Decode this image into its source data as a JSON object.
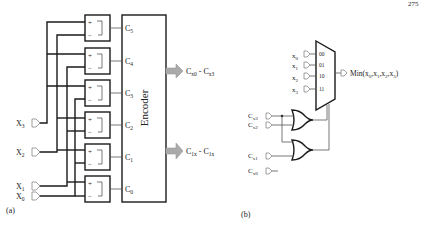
{
  "page_number": "275",
  "panel_a": {
    "caption": "(a)",
    "inputs": [
      {
        "name": "X",
        "sub": "3"
      },
      {
        "name": "X",
        "sub": "2"
      },
      {
        "name": "X",
        "sub": "1"
      },
      {
        "name": "X",
        "sub": "0"
      }
    ],
    "comparators": [
      {
        "plus": "+",
        "minus": "−",
        "out": "C",
        "out_sub": "5"
      },
      {
        "plus": "+",
        "minus": "−",
        "out": "C",
        "out_sub": "4"
      },
      {
        "plus": "+",
        "minus": "−",
        "out": "C",
        "out_sub": "3"
      },
      {
        "plus": "+",
        "minus": "−",
        "out": "C",
        "out_sub": "2"
      },
      {
        "plus": "+",
        "minus": "−",
        "out": "C",
        "out_sub": "1"
      },
      {
        "plus": "+",
        "minus": "−",
        "out": "C",
        "out_sub": "0"
      }
    ],
    "encoder_label": "Encoder",
    "outputs": [
      {
        "from": "C",
        "from_sub": "x0",
        "sep": " - ",
        "to": "C",
        "to_sub": "x3"
      },
      {
        "from": "C",
        "from_sub": "1x",
        "sep": " - ",
        "to": "C",
        "to_sub": "1x"
      }
    ]
  },
  "panel_b": {
    "caption": "(b)",
    "mux_inputs": [
      {
        "name": "x",
        "sub": "0",
        "sel": "00"
      },
      {
        "name": "x",
        "sub": "1",
        "sel": "01"
      },
      {
        "name": "x",
        "sub": "2",
        "sel": "10"
      },
      {
        "name": "x",
        "sub": "3",
        "sel": "11"
      }
    ],
    "mux_output": "Min(x",
    "mux_output_full": "Min(x0,x1,x2,x3)",
    "control_inputs": [
      {
        "name": "C",
        "sub": "x3"
      },
      {
        "name": "C",
        "sub": "x2"
      },
      {
        "name": "C",
        "sub": "x1"
      },
      {
        "name": "C",
        "sub": "x0"
      }
    ],
    "gates": [
      "OR",
      "OR"
    ]
  }
}
